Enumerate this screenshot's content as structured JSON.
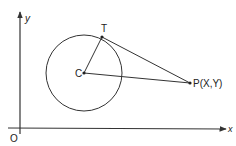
{
  "diagram": {
    "type": "geometry",
    "axes": {
      "origin_label": "O",
      "x_label": "x",
      "y_label": "y"
    },
    "points": {
      "center": {
        "label": "C"
      },
      "tangent_point": {
        "label": "T"
      },
      "external_point": {
        "label": "P(X,Y)",
        "name": "P",
        "coords": "X,Y"
      }
    },
    "segments": [
      "CT",
      "TP",
      "CP"
    ],
    "colors": {
      "stroke": "#333333",
      "background": "#ffffff"
    }
  }
}
